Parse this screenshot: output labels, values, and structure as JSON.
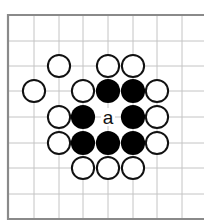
{
  "diagram": {
    "type": "go-board-fragment",
    "colors": {
      "background": "#ffffff",
      "border": "#8a8a8a",
      "grid": "#c4c4c4",
      "black_stone": "#000000",
      "white_stone_fill": "#ffffff",
      "white_stone_stroke": "#111111"
    },
    "grid": {
      "columns_x": [
        8,
        34,
        59,
        83,
        108,
        133,
        157,
        182
      ],
      "rows_y": [
        15,
        41,
        66,
        91,
        117,
        143,
        168,
        194,
        219
      ],
      "edges": {
        "left": true,
        "top": true,
        "bottom": true,
        "right": false
      },
      "right_extent": 204
    },
    "stone_radius": 11.5,
    "stones": [
      {
        "color": "white",
        "col": 2,
        "row": 2
      },
      {
        "color": "white",
        "col": 4,
        "row": 2
      },
      {
        "color": "white",
        "col": 5,
        "row": 2
      },
      {
        "color": "white",
        "col": 1,
        "row": 3
      },
      {
        "color": "white",
        "col": 3,
        "row": 3
      },
      {
        "color": "black",
        "col": 4,
        "row": 3
      },
      {
        "color": "black",
        "col": 5,
        "row": 3
      },
      {
        "color": "white",
        "col": 6,
        "row": 3
      },
      {
        "color": "white",
        "col": 2,
        "row": 4
      },
      {
        "color": "black",
        "col": 3,
        "row": 4
      },
      {
        "color": "black",
        "col": 5,
        "row": 4
      },
      {
        "color": "white",
        "col": 6,
        "row": 4
      },
      {
        "color": "white",
        "col": 2,
        "row": 5
      },
      {
        "color": "black",
        "col": 3,
        "row": 5
      },
      {
        "color": "black",
        "col": 4,
        "row": 5
      },
      {
        "color": "black",
        "col": 5,
        "row": 5
      },
      {
        "color": "white",
        "col": 6,
        "row": 5
      },
      {
        "color": "white",
        "col": 3,
        "row": 6
      },
      {
        "color": "white",
        "col": 4,
        "row": 6
      },
      {
        "color": "white",
        "col": 5,
        "row": 6
      }
    ],
    "labels": [
      {
        "text": "a",
        "col": 4,
        "row": 4
      }
    ]
  }
}
